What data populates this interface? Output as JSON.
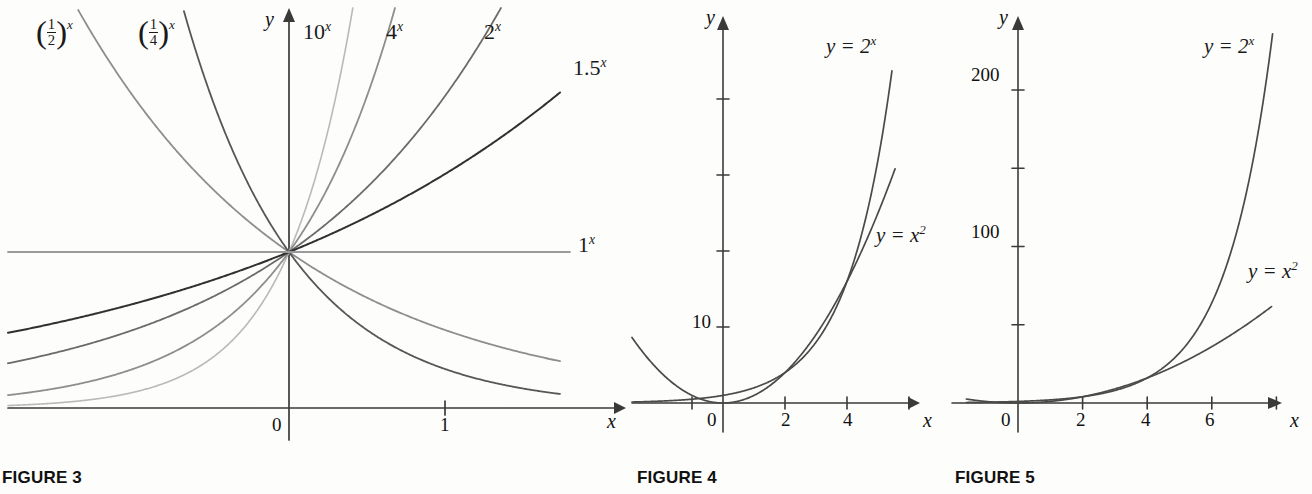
{
  "figures": [
    {
      "caption": "FIGURE 3",
      "axis": {
        "x_label": "x",
        "y_label": "y"
      },
      "x_ticks": [
        {
          "value": 0,
          "label": "0"
        },
        {
          "value": 1,
          "label": "1"
        }
      ],
      "curve_labels": [
        {
          "text": "(1/2)^x",
          "base": 0.5,
          "display": "x"
        },
        {
          "text": "(1/4)^x",
          "base": 0.25,
          "display": "x"
        },
        {
          "text": "10^x",
          "base": 10,
          "display": "10"
        },
        {
          "text": "4^x",
          "base": 4,
          "display": "4"
        },
        {
          "text": "2^x",
          "base": 2,
          "display": "2"
        },
        {
          "text": "1.5^x",
          "base": 1.5,
          "display": "1.5"
        },
        {
          "text": "1^x",
          "base": 1,
          "display": "1"
        }
      ]
    },
    {
      "caption": "FIGURE 4",
      "axis": {
        "x_label": "x",
        "y_label": "y"
      },
      "x_ticks": [
        {
          "value": -1,
          "label": ""
        },
        {
          "value": 0,
          "label": "0"
        },
        {
          "value": 2,
          "label": "2"
        },
        {
          "value": 4,
          "label": "4"
        },
        {
          "value": 6,
          "label": ""
        }
      ],
      "y_ticks": [
        {
          "value": 10,
          "label": "10"
        },
        {
          "value": 20,
          "label": ""
        },
        {
          "value": 30,
          "label": ""
        },
        {
          "value": 40,
          "label": ""
        }
      ],
      "curve_labels": [
        {
          "text": "y = 2^x"
        },
        {
          "text": "y = x^2"
        }
      ]
    },
    {
      "caption": "FIGURE 5",
      "axis": {
        "x_label": "x",
        "y_label": "y"
      },
      "x_ticks": [
        {
          "value": 0,
          "label": "0"
        },
        {
          "value": 2,
          "label": "2"
        },
        {
          "value": 4,
          "label": "4"
        },
        {
          "value": 6,
          "label": "6"
        },
        {
          "value": 8,
          "label": ""
        }
      ],
      "y_ticks": [
        {
          "value": 50,
          "label": ""
        },
        {
          "value": 100,
          "label": "100"
        },
        {
          "value": 150,
          "label": ""
        },
        {
          "value": 200,
          "label": "200"
        }
      ],
      "curve_labels": [
        {
          "text": "y = 2^x"
        },
        {
          "text": "y = x^2"
        }
      ]
    }
  ],
  "labels": {
    "fig3_half": "x",
    "fig3_half_num": "1",
    "fig3_half_den": "2",
    "fig3_quarter": "x",
    "fig3_quarter_num": "1",
    "fig3_quarter_den": "4",
    "fig3_ten": "10",
    "fig3_ten_exp": "x",
    "fig3_four": "4",
    "fig3_four_exp": "x",
    "fig3_two": "2",
    "fig3_two_exp": "x",
    "fig3_onefive": "1.5",
    "fig3_onefive_exp": "x",
    "fig3_one": "1",
    "fig3_one_exp": "x",
    "fig3_x": "x",
    "fig3_y": "y",
    "fig3_t0": "0",
    "fig3_t1": "1",
    "fig4_x": "x",
    "fig4_y": "y",
    "fig4_t0": "0",
    "fig4_t2": "2",
    "fig4_t4": "4",
    "fig4_y10": "10",
    "fig4_c1_lhs": "y = 2",
    "fig4_c1_exp": "x",
    "fig4_c2_lhs": "y = x",
    "fig4_c2_exp": "2",
    "fig5_x": "x",
    "fig5_y": "y",
    "fig5_t0": "0",
    "fig5_t2": "2",
    "fig5_t4": "4",
    "fig5_t6": "6",
    "fig5_y100": "100",
    "fig5_y200": "200",
    "fig5_c1_lhs": "y = 2",
    "fig5_c1_exp": "x",
    "fig5_c2_lhs": "y = x",
    "fig5_c2_exp": "2",
    "cap3": "FIGURE 3",
    "cap4": "FIGURE 4",
    "cap5": "FIGURE 5"
  },
  "chart_data": [
    {
      "type": "line",
      "title": "FIGURE 3",
      "xlabel": "x",
      "ylabel": "y",
      "xlim": [
        -2.75,
        2.2
      ],
      "ylim": [
        0,
        4.2
      ],
      "grid": false,
      "legend": "inline-curve-labels",
      "xticks": [
        0,
        1
      ],
      "xticklabels": [
        "0",
        "1"
      ],
      "series": [
        {
          "name": "(1/2)^x",
          "base": 0.5,
          "color": "#8e8e8e"
        },
        {
          "name": "(1/4)^x",
          "base": 0.25,
          "color": "#575757"
        },
        {
          "name": "10^x",
          "base": 10,
          "color": "#b9b9b9"
        },
        {
          "name": "4^x",
          "base": 4,
          "color": "#8e8e8e"
        },
        {
          "name": "2^x",
          "base": 2,
          "color": "#6b6b6b"
        },
        {
          "name": "1.5^x",
          "base": 1.5,
          "color": "#303030"
        },
        {
          "name": "1^x",
          "base": 1,
          "color": "#9a9a9a"
        }
      ]
    },
    {
      "type": "line",
      "title": "FIGURE 4",
      "xlabel": "x",
      "ylabel": "y",
      "xlim": [
        -2.9,
        6.4
      ],
      "ylim": [
        -3,
        46
      ],
      "grid": false,
      "legend": "inline-curve-labels",
      "xticks": [
        -1,
        2,
        4,
        6
      ],
      "xticklabels": [
        "",
        "2",
        "4",
        ""
      ],
      "yticks": [
        10,
        20,
        30,
        40
      ],
      "yticklabels": [
        "10",
        "",
        "",
        ""
      ],
      "series": [
        {
          "name": "y = 2^x",
          "func": "2^x",
          "color": "#4a4a4a"
        },
        {
          "name": "y = x^2",
          "func": "x^2",
          "color": "#4a4a4a"
        }
      ]
    },
    {
      "type": "line",
      "title": "FIGURE 5",
      "xlabel": "x",
      "ylabel": "y",
      "xlim": [
        -1.8,
        9.2
      ],
      "ylim": [
        -14,
        270
      ],
      "grid": false,
      "legend": "inline-curve-labels",
      "xticks": [
        0,
        2,
        4,
        6,
        8
      ],
      "xticklabels": [
        "0",
        "2",
        "4",
        "6",
        ""
      ],
      "yticks": [
        50,
        100,
        150,
        200
      ],
      "yticklabels": [
        "",
        "100",
        "",
        "200"
      ],
      "series": [
        {
          "name": "y = 2^x",
          "func": "2^x",
          "color": "#4a4a4a"
        },
        {
          "name": "y = x^2",
          "func": "x^2",
          "color": "#4a4a4a"
        }
      ]
    }
  ]
}
